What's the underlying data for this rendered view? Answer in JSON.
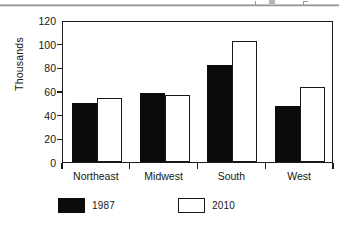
{
  "chart_data": {
    "type": "bar",
    "title": "",
    "subtitle": "",
    "xlabel": "",
    "ylabel": "Thousands",
    "categories": [
      "Northeast",
      "Midwest",
      "South",
      "West"
    ],
    "series": [
      {
        "name": "1987",
        "color": "#0b0b0b",
        "style": "filled",
        "values": [
          50,
          58,
          82,
          47
        ]
      },
      {
        "name": "2010",
        "color": "#ffffff",
        "style": "hollow",
        "values": [
          54,
          57,
          102,
          63
        ]
      }
    ],
    "ylim": [
      0,
      120
    ],
    "ytick_values": [
      0,
      20,
      40,
      60,
      80,
      100,
      120
    ],
    "ytick_labels": [
      "0",
      "20",
      "40",
      "60",
      "80",
      "100",
      "120"
    ],
    "grid": false,
    "legend_position": "below-left",
    "frame": "box"
  },
  "legend": {
    "entries": [
      {
        "label": "1987",
        "style": "filled"
      },
      {
        "label": "2010",
        "style": "hollow"
      }
    ]
  }
}
